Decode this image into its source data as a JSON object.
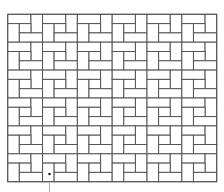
{
  "diagram": {
    "type": "pinwheel-tiling",
    "canvas": {
      "width": 224,
      "height": 192,
      "background": "#ffffff"
    },
    "grid": {
      "origin_x": 7.7,
      "origin_y": 14.3,
      "tile_width": 34.83,
      "tile_height": 27.9,
      "cols": 6,
      "rows": 6,
      "subdivisions": 3
    },
    "tile_pieces": [
      {
        "name": "top-bar",
        "col": 0,
        "row": 0,
        "w": 2,
        "h": 1
      },
      {
        "name": "right-post",
        "col": 2,
        "row": 0,
        "w": 1,
        "h": 2
      },
      {
        "name": "left-post",
        "col": 0,
        "row": 1,
        "w": 1,
        "h": 2
      },
      {
        "name": "center-square",
        "col": 1,
        "row": 1,
        "w": 1,
        "h": 1
      },
      {
        "name": "bottom-bar",
        "col": 1,
        "row": 2,
        "w": 2,
        "h": 1
      }
    ],
    "stroke": {
      "color": "#555555",
      "width": 1
    },
    "marker": {
      "x": 49.5,
      "y": 174,
      "radius": 1.3,
      "color": "#222222"
    },
    "leader_line": {
      "x": 49.5,
      "y1": 182,
      "y2": 192,
      "color": "#aaaaaa"
    }
  }
}
